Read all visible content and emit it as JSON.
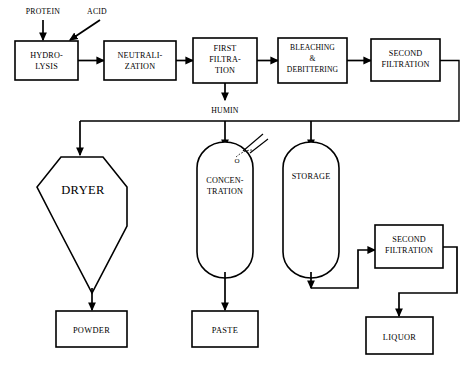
{
  "diagram": {
    "type": "process-flow",
    "colors": {
      "stroke": "#000000",
      "fill": "#ffffff",
      "background": "#ffffff"
    },
    "inputs": [
      {
        "id": "protein",
        "label": "PROTEIN",
        "arrow": "vertical",
        "target": "hydrolysis"
      },
      {
        "id": "acid",
        "label": "ACID",
        "arrow": "diagonal",
        "target": "hydrolysis"
      }
    ],
    "process_row": [
      {
        "id": "hydrolysis",
        "lines": [
          "HYDRO-",
          "LYSIS"
        ]
      },
      {
        "id": "neutralization",
        "lines": [
          "NEUTRALI-",
          "ZATION"
        ]
      },
      {
        "id": "first-filtration",
        "lines": [
          "FIRST",
          "FILTRA-",
          "TION"
        ]
      },
      {
        "id": "bleaching-debittering",
        "lines": [
          "BLEACHING",
          "&",
          "DEBITTERING"
        ]
      },
      {
        "id": "second-filtration-top",
        "lines": [
          "SECOND",
          "FILTRATION"
        ]
      }
    ],
    "streams": [
      {
        "id": "humin",
        "label": "HUMIN",
        "from": "first-filtration"
      }
    ],
    "vessels": [
      {
        "id": "dryer",
        "label": "DRYER",
        "shape": "hopper-polygon"
      },
      {
        "id": "concentration",
        "lines": [
          "CONCEN-",
          "TRATION"
        ],
        "shape": "capsule"
      },
      {
        "id": "storage",
        "lines": [
          "STORAGE"
        ],
        "shape": "capsule"
      }
    ],
    "secondary_units": [
      {
        "id": "second-filtration-bottom",
        "lines": [
          "SECOND",
          "FILTRATION"
        ]
      }
    ],
    "products": [
      {
        "id": "powder",
        "label": "POWDER",
        "from": "dryer"
      },
      {
        "id": "paste",
        "label": "PASTE",
        "from": "concentration"
      },
      {
        "id": "liquor",
        "label": "LIQUOR",
        "from": "second-filtration-bottom"
      }
    ],
    "annotations": [
      {
        "id": "vent-mark",
        "label": "O"
      }
    ]
  }
}
